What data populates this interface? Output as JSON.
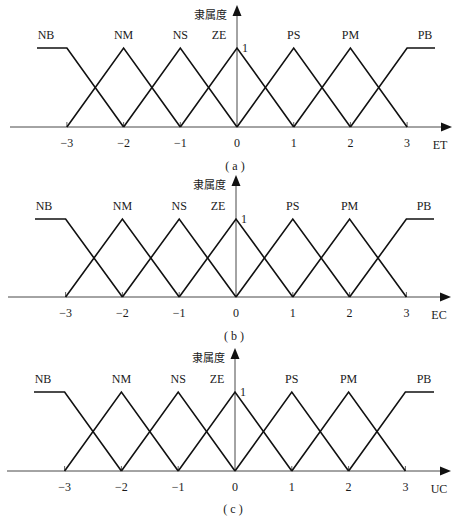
{
  "figure": {
    "y_axis_label": "隶属度",
    "peak_label": "1",
    "sets": [
      "NB",
      "NM",
      "NS",
      "ZE",
      "PS",
      "PM",
      "PB"
    ],
    "ticks": [
      "−3",
      "−2",
      "−1",
      "0",
      "1",
      "2",
      "3"
    ],
    "panels": [
      {
        "caption": "( a )",
        "x_axis_label": "ET"
      },
      {
        "caption": "( b )",
        "x_axis_label": "EC"
      },
      {
        "caption": "( c )",
        "x_axis_label": "UC"
      }
    ],
    "colors": {
      "line": "#111111",
      "axis": "#333333",
      "background": "#ffffff"
    }
  },
  "chart_data": [
    {
      "type": "line",
      "title": "( a )",
      "xlabel": "ET",
      "ylabel": "隶属度",
      "xlim": [
        -3,
        3
      ],
      "ylim": [
        0,
        1
      ],
      "x_ticks": [
        -3,
        -2,
        -1,
        0,
        1,
        2,
        3
      ],
      "series": [
        {
          "name": "NB",
          "shape": "z-shaped",
          "points": [
            [
              -3.5,
              1
            ],
            [
              -3,
              1
            ],
            [
              -2,
              0
            ]
          ]
        },
        {
          "name": "NM",
          "shape": "triangle",
          "points": [
            [
              -3,
              0
            ],
            [
              -2,
              1
            ],
            [
              -1,
              0
            ]
          ]
        },
        {
          "name": "NS",
          "shape": "triangle",
          "points": [
            [
              -2,
              0
            ],
            [
              -1,
              1
            ],
            [
              0,
              0
            ]
          ]
        },
        {
          "name": "ZE",
          "shape": "triangle",
          "points": [
            [
              -1,
              0
            ],
            [
              0,
              1
            ],
            [
              1,
              0
            ]
          ]
        },
        {
          "name": "PS",
          "shape": "triangle",
          "points": [
            [
              0,
              0
            ],
            [
              1,
              1
            ],
            [
              2,
              0
            ]
          ]
        },
        {
          "name": "PM",
          "shape": "triangle",
          "points": [
            [
              1,
              0
            ],
            [
              2,
              1
            ],
            [
              3,
              0
            ]
          ]
        },
        {
          "name": "PB",
          "shape": "s-shaped",
          "points": [
            [
              2,
              0
            ],
            [
              3,
              1
            ],
            [
              3.5,
              1
            ]
          ]
        }
      ]
    },
    {
      "type": "line",
      "title": "( b )",
      "xlabel": "EC",
      "ylabel": "隶属度",
      "xlim": [
        -3,
        3
      ],
      "ylim": [
        0,
        1
      ],
      "x_ticks": [
        -3,
        -2,
        -1,
        0,
        1,
        2,
        3
      ],
      "series": [
        {
          "name": "NB",
          "shape": "z-shaped",
          "points": [
            [
              -3.5,
              1
            ],
            [
              -3,
              1
            ],
            [
              -2,
              0
            ]
          ]
        },
        {
          "name": "NM",
          "shape": "triangle",
          "points": [
            [
              -3,
              0
            ],
            [
              -2,
              1
            ],
            [
              -1,
              0
            ]
          ]
        },
        {
          "name": "NS",
          "shape": "triangle",
          "points": [
            [
              -2,
              0
            ],
            [
              -1,
              1
            ],
            [
              0,
              0
            ]
          ]
        },
        {
          "name": "ZE",
          "shape": "triangle",
          "points": [
            [
              -1,
              0
            ],
            [
              0,
              1
            ],
            [
              1,
              0
            ]
          ]
        },
        {
          "name": "PS",
          "shape": "triangle",
          "points": [
            [
              0,
              0
            ],
            [
              1,
              1
            ],
            [
              2,
              0
            ]
          ]
        },
        {
          "name": "PM",
          "shape": "triangle",
          "points": [
            [
              1,
              0
            ],
            [
              2,
              1
            ],
            [
              3,
              0
            ]
          ]
        },
        {
          "name": "PB",
          "shape": "s-shaped",
          "points": [
            [
              2,
              0
            ],
            [
              3,
              1
            ],
            [
              3.5,
              1
            ]
          ]
        }
      ]
    },
    {
      "type": "line",
      "title": "( c )",
      "xlabel": "UC",
      "ylabel": "隶属度",
      "xlim": [
        -3,
        3
      ],
      "ylim": [
        0,
        1
      ],
      "x_ticks": [
        -3,
        -2,
        -1,
        0,
        1,
        2,
        3
      ],
      "series": [
        {
          "name": "NB",
          "shape": "z-shaped",
          "points": [
            [
              -3.5,
              1
            ],
            [
              -3,
              1
            ],
            [
              -2,
              0
            ]
          ]
        },
        {
          "name": "NM",
          "shape": "triangle",
          "points": [
            [
              -3,
              0
            ],
            [
              -2,
              1
            ],
            [
              -1,
              0
            ]
          ]
        },
        {
          "name": "NS",
          "shape": "triangle",
          "points": [
            [
              -2,
              0
            ],
            [
              -1,
              1
            ],
            [
              0,
              0
            ]
          ]
        },
        {
          "name": "ZE",
          "shape": "triangle",
          "points": [
            [
              -1,
              0
            ],
            [
              0,
              1
            ],
            [
              1,
              0
            ]
          ]
        },
        {
          "name": "PS",
          "shape": "triangle",
          "points": [
            [
              0,
              0
            ],
            [
              1,
              1
            ],
            [
              2,
              0
            ]
          ]
        },
        {
          "name": "PM",
          "shape": "triangle",
          "points": [
            [
              1,
              0
            ],
            [
              2,
              1
            ],
            [
              3,
              0
            ]
          ]
        },
        {
          "name": "PB",
          "shape": "s-shaped",
          "points": [
            [
              2,
              0
            ],
            [
              3,
              1
            ],
            [
              3.5,
              1
            ]
          ]
        }
      ]
    }
  ]
}
